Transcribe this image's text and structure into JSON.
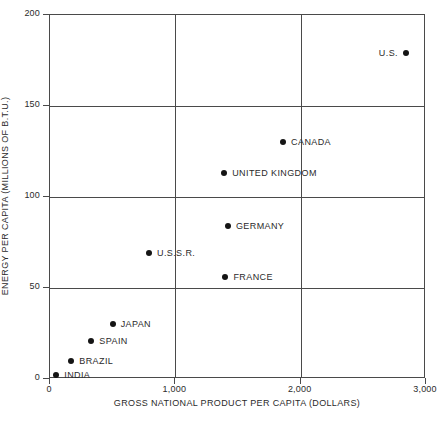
{
  "chart_data": {
    "type": "scatter",
    "title": "",
    "xlabel": "GROSS NATIONAL PRODUCT PER CAPITA (DOLLARS)",
    "ylabel": "ENERGY PER CAPITA (MILLIONS OF B.T.U.)",
    "xlim": [
      0,
      3000
    ],
    "ylim": [
      0,
      200
    ],
    "xticks": [
      "0",
      "1,000",
      "2,000",
      "3,000"
    ],
    "xtick_values": [
      0,
      1000,
      2000,
      3000
    ],
    "yticks": [
      "0",
      "50",
      "100",
      "150",
      "200"
    ],
    "ytick_values": [
      0,
      50,
      100,
      150,
      200
    ],
    "grid": "major-xy",
    "legend": "none",
    "point_label_position": "right",
    "points": [
      {
        "label": "U.S.",
        "x": 2840,
        "y": 179,
        "label_side": "left"
      },
      {
        "label": "CANADA",
        "x": 1860,
        "y": 130,
        "label_side": "right"
      },
      {
        "label": "UNITED KINGDOM",
        "x": 1390,
        "y": 113,
        "label_side": "right"
      },
      {
        "label": "GERMANY",
        "x": 1420,
        "y": 84,
        "label_side": "right"
      },
      {
        "label": "FRANCE",
        "x": 1400,
        "y": 56,
        "label_side": "right"
      },
      {
        "label": "U.S.S.R.",
        "x": 790,
        "y": 69,
        "label_side": "right"
      },
      {
        "label": "JAPAN",
        "x": 500,
        "y": 30,
        "label_side": "right"
      },
      {
        "label": "SPAIN",
        "x": 330,
        "y": 21,
        "label_side": "right"
      },
      {
        "label": "BRAZIL",
        "x": 170,
        "y": 10,
        "label_side": "right"
      },
      {
        "label": "INDIA",
        "x": 50,
        "y": 2,
        "label_side": "right"
      }
    ],
    "colors": {
      "marker": "#151515",
      "axis": "#4a4a4a",
      "text": "#2b2b2b",
      "background": "#ffffff"
    }
  }
}
